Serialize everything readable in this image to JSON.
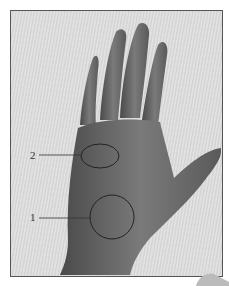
{
  "figure": {
    "labels": [
      {
        "id": "2",
        "text": "2",
        "region": "upper palm ellipse"
      },
      {
        "id": "1",
        "text": "1",
        "region": "lower palm circle"
      }
    ],
    "colors": {
      "skin": "#6e6e6e",
      "background": "#dcdcdc",
      "outline": "#222222"
    }
  }
}
